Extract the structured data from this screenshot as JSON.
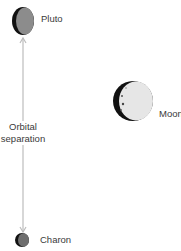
{
  "diagram": {
    "bodies": [
      {
        "name": "Pluto",
        "label": "Pluto"
      },
      {
        "name": "Moon",
        "label": "Moon"
      },
      {
        "name": "Charon",
        "label": "Charon"
      }
    ],
    "separation": {
      "line1": "Orbital",
      "line2": "separation"
    }
  }
}
